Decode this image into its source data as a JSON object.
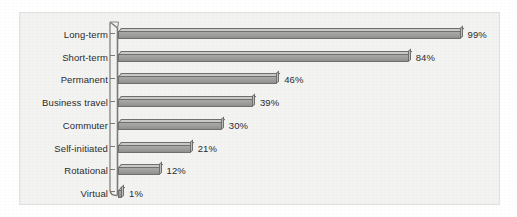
{
  "chart_data": {
    "type": "bar",
    "orientation": "horizontal",
    "title": "",
    "subtitle": "",
    "xlabel": "",
    "ylabel": "",
    "categories": [
      "Long-term",
      "Short-term",
      "Permanent",
      "Business travel",
      "Commuter",
      "Self-initiated",
      "Rotational",
      "Virtual"
    ],
    "values": [
      99,
      84,
      46,
      39,
      30,
      21,
      12,
      1
    ],
    "value_labels": [
      "99%",
      "84%",
      "46%",
      "39%",
      "30%",
      "21%",
      "12%",
      "1%"
    ],
    "unit": "%",
    "xlim": [
      0,
      100
    ],
    "grid": false,
    "legend": null,
    "series": [
      {
        "name": "Share",
        "values": [
          99,
          84,
          46,
          39,
          30,
          21,
          12,
          1
        ]
      }
    ],
    "colors": {
      "bar_face": "#9d9d9b",
      "bar_top": "#c9c9c7",
      "bar_outline": "#6f6f6d",
      "axis": "#7a7a78",
      "background": "#f3f3f2",
      "text": "#2b2b2b"
    }
  }
}
